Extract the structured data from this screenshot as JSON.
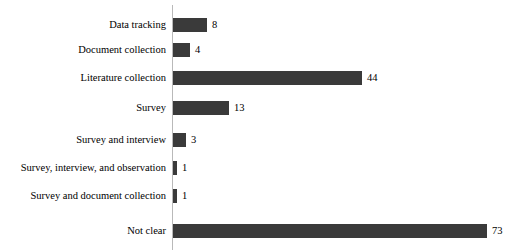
{
  "chart_data": {
    "type": "bar",
    "orientation": "horizontal",
    "title": "",
    "xlabel": "",
    "ylabel": "",
    "grid": false,
    "legend": null,
    "xlim": [
      0,
      73
    ],
    "categories": [
      "Data tracking",
      "Document collection",
      "Literature collection",
      "Survey",
      "Survey and interview",
      "Survey, interview, and observation",
      "Survey and document collection",
      "Not clear"
    ],
    "values": [
      8,
      4,
      44,
      13,
      3,
      1,
      1,
      73
    ],
    "value_labels": [
      "8",
      "4",
      "44",
      "13",
      "3",
      "1",
      "1",
      "73"
    ],
    "bar_color": "#3a3a3a",
    "axis_color": "#b9b9b9",
    "background_color": "#ffffff",
    "text_color": "#000000"
  },
  "layout": {
    "axis_x": 172,
    "px_per_unit": 4.3,
    "bar_height": 14,
    "row_centers": [
      25,
      50,
      78,
      108,
      140,
      168,
      196,
      231
    ]
  }
}
